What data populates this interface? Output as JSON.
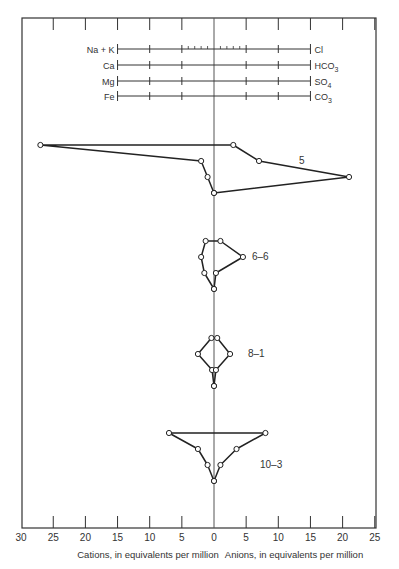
{
  "chart_data": {
    "type": "stiff-diagram",
    "title": "",
    "xlabel_left": "Cations, in equivalents per million",
    "xlabel_right": "Anions, in equivalents per million",
    "x_ticks": [
      {
        "value": -30,
        "label": "30"
      },
      {
        "value": -25,
        "label": "25"
      },
      {
        "value": -20,
        "label": "20"
      },
      {
        "value": -15,
        "label": "15"
      },
      {
        "value": -10,
        "label": "10"
      },
      {
        "value": -5,
        "label": "5"
      },
      {
        "value": 0,
        "label": "0"
      },
      {
        "value": 5,
        "label": "5"
      },
      {
        "value": 10,
        "label": "10"
      },
      {
        "value": 15,
        "label": "15"
      },
      {
        "value": 20,
        "label": "20"
      },
      {
        "value": 25,
        "label": "25"
      }
    ],
    "xlim": [
      -30,
      25
    ],
    "legend_scale": {
      "range": [
        -15,
        15
      ],
      "rows": [
        {
          "cation": "Na + K",
          "anion": "Cl",
          "anion_sub": ""
        },
        {
          "cation": "Ca",
          "anion": "HCO",
          "anion_sub": "3"
        },
        {
          "cation": "Mg",
          "anion": "SO",
          "anion_sub": "4"
        },
        {
          "cation": "Fe",
          "anion": "CO",
          "anion_sub": "3"
        }
      ]
    },
    "ions_order": {
      "cations": [
        "Na + K",
        "Ca",
        "Mg",
        "Fe"
      ],
      "anions": [
        "Cl",
        "HCO3",
        "SO4",
        "CO3"
      ]
    },
    "series": [
      {
        "name": "5",
        "cations": [
          27,
          2,
          1,
          0
        ],
        "anions": [
          3,
          7,
          21,
          0
        ]
      },
      {
        "name": "6-6",
        "cations": [
          1.3,
          2,
          1.5,
          0
        ],
        "anions": [
          1,
          4.5,
          0.3,
          0
        ]
      },
      {
        "name": "8-1",
        "cations": [
          0.4,
          2.5,
          0.3,
          0
        ],
        "anions": [
          0.5,
          2.5,
          0.3,
          0
        ]
      },
      {
        "name": "10-3",
        "cations": [
          7,
          2.5,
          1,
          0
        ],
        "anions": [
          8,
          3.5,
          1,
          0
        ]
      }
    ]
  }
}
